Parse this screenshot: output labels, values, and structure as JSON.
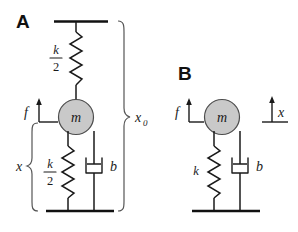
{
  "figure": {
    "background_color": "#ffffff",
    "ink_color": "#1a1a1a",
    "mass_fill_color": "#c9c9c9",
    "mass_stroke_color": "#4d4d4d",
    "brace_color": "#555555"
  },
  "panels": [
    {
      "id": "A",
      "letter": "A",
      "mass_label": "m",
      "force_label": "f",
      "springs": [
        {
          "id": "upper",
          "numerator": "k",
          "denominator": "2"
        },
        {
          "id": "lower",
          "numerator": "k",
          "denominator": "2"
        }
      ],
      "damper_label": "b",
      "measurements": [
        {
          "id": "x0",
          "base": "x",
          "subscript": "0"
        },
        {
          "id": "x",
          "base": "x",
          "subscript": ""
        }
      ]
    },
    {
      "id": "B",
      "letter": "B",
      "mass_label": "m",
      "force_label": "f",
      "springs": [
        {
          "id": "single",
          "numerator": "k",
          "denominator": ""
        }
      ],
      "damper_label": "b",
      "measurements": [
        {
          "id": "x",
          "base": "x",
          "subscript": ""
        }
      ]
    }
  ]
}
